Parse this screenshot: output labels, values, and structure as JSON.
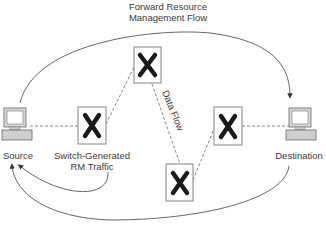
{
  "diagram": {
    "title_line1": "Forward Resource",
    "title_line2": "Management Flow",
    "nodes": {
      "source": {
        "label": "Source",
        "icon": "computer-icon"
      },
      "destination": {
        "label": "Destination",
        "icon": "computer-icon"
      },
      "switch_top": {
        "icon": "switch-x-icon"
      },
      "switch_left": {
        "icon": "switch-x-icon",
        "caption_line1": "Switch-Generated",
        "caption_line2": "RM Traffic"
      },
      "switch_right": {
        "icon": "switch-x-icon"
      },
      "switch_bottom": {
        "icon": "switch-x-icon"
      }
    },
    "edges": {
      "data_flow_label": "Data Flow"
    },
    "colors": {
      "line": "#555555",
      "dashed": "#777777",
      "x_mark": "#1a1a1a",
      "monitor_fill": "#d8d8d8"
    }
  }
}
